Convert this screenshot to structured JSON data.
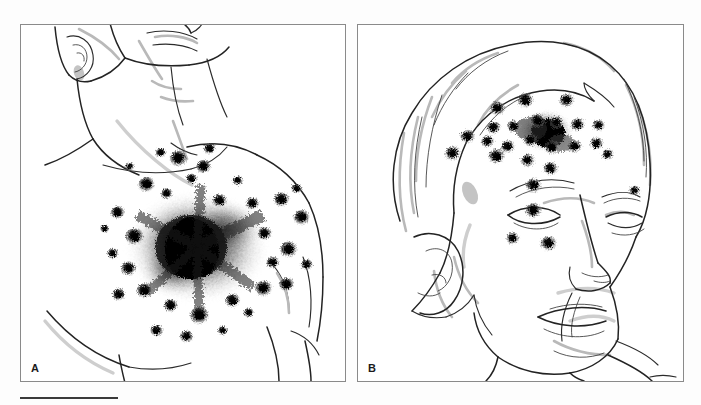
{
  "figure": {
    "background_color": "#fdfdfd",
    "ink_color": "#2b2b2b",
    "shade_color": "#c0c0c0",
    "soot_color": "#000000",
    "scale_bar": {
      "name": "scale-bar",
      "length_px": 98,
      "thickness_px": 2,
      "color": "#3a3a3a"
    }
  },
  "panels": [
    {
      "id": "A",
      "label": "A",
      "subject": "male-torso-chest",
      "view": "anterior chest and neck, head turned to subject's left",
      "wound": {
        "type": "contact-gunshot-entrance-wound",
        "location": "left anterior chest",
        "center_x": 192,
        "center_y": 245,
        "core_radius_px": 22,
        "soot_halo_radius_px": 78,
        "features": [
          "central perforation",
          "dense soot blackening",
          "surrounding powder tattooing",
          "satellite powder marks"
        ]
      },
      "stipple_count": 34
    },
    {
      "id": "B",
      "label": "B",
      "subject": "male-head-face",
      "view": "three-quarter left facial profile",
      "wound": {
        "type": "close-range-gunshot-entrance-wound",
        "location": "right forehead / supraorbital region",
        "center_x": 545,
        "center_y": 130,
        "core_radius_px": 12,
        "soot_halo_radius_px": 26,
        "features": [
          "entrance defect",
          "soot deposit",
          "dense powder tattooing over forehead and cheek"
        ]
      },
      "stipple_count": 26
    }
  ],
  "stipple_a": [
    {
      "x": 178,
      "y": 158,
      "r": 5.0
    },
    {
      "x": 203,
      "y": 166,
      "r": 4.2
    },
    {
      "x": 146,
      "y": 184,
      "r": 4.6
    },
    {
      "x": 117,
      "y": 212,
      "r": 4.0
    },
    {
      "x": 166,
      "y": 193,
      "r": 3.4
    },
    {
      "x": 219,
      "y": 200,
      "r": 4.0
    },
    {
      "x": 252,
      "y": 203,
      "r": 3.8
    },
    {
      "x": 281,
      "y": 199,
      "r": 4.4
    },
    {
      "x": 301,
      "y": 217,
      "r": 4.6
    },
    {
      "x": 264,
      "y": 233,
      "r": 4.0
    },
    {
      "x": 288,
      "y": 249,
      "r": 4.8
    },
    {
      "x": 134,
      "y": 236,
      "r": 5.2
    },
    {
      "x": 128,
      "y": 268,
      "r": 4.4
    },
    {
      "x": 144,
      "y": 290,
      "r": 4.6
    },
    {
      "x": 118,
      "y": 294,
      "r": 3.8
    },
    {
      "x": 170,
      "y": 305,
      "r": 4.0
    },
    {
      "x": 199,
      "y": 315,
      "r": 5.4
    },
    {
      "x": 232,
      "y": 300,
      "r": 4.2
    },
    {
      "x": 263,
      "y": 288,
      "r": 4.8
    },
    {
      "x": 286,
      "y": 284,
      "r": 4.2
    },
    {
      "x": 272,
      "y": 262,
      "r": 3.6
    },
    {
      "x": 156,
      "y": 330,
      "r": 3.6
    },
    {
      "x": 186,
      "y": 336,
      "r": 3.8
    },
    {
      "x": 112,
      "y": 253,
      "r": 3.2
    },
    {
      "x": 237,
      "y": 180,
      "r": 3.0
    },
    {
      "x": 191,
      "y": 178,
      "r": 3.2
    },
    {
      "x": 248,
      "y": 312,
      "r": 3.0
    },
    {
      "x": 306,
      "y": 264,
      "r": 3.4
    },
    {
      "x": 160,
      "y": 152,
      "r": 3.0
    },
    {
      "x": 209,
      "y": 148,
      "r": 3.4
    },
    {
      "x": 129,
      "y": 166,
      "r": 2.6
    },
    {
      "x": 296,
      "y": 188,
      "r": 3.0
    },
    {
      "x": 222,
      "y": 330,
      "r": 2.8
    },
    {
      "x": 104,
      "y": 228,
      "r": 2.6
    }
  ],
  "stipple_b": [
    {
      "x": 497,
      "y": 108,
      "r": 4.4
    },
    {
      "x": 525,
      "y": 100,
      "r": 4.6
    },
    {
      "x": 566,
      "y": 100,
      "r": 4.2
    },
    {
      "x": 493,
      "y": 127,
      "r": 4.0
    },
    {
      "x": 513,
      "y": 126,
      "r": 3.8
    },
    {
      "x": 537,
      "y": 120,
      "r": 4.2
    },
    {
      "x": 556,
      "y": 122,
      "r": 3.8
    },
    {
      "x": 577,
      "y": 124,
      "r": 4.0
    },
    {
      "x": 598,
      "y": 125,
      "r": 3.6
    },
    {
      "x": 467,
      "y": 136,
      "r": 4.2
    },
    {
      "x": 487,
      "y": 141,
      "r": 3.8
    },
    {
      "x": 507,
      "y": 146,
      "r": 4.0
    },
    {
      "x": 530,
      "y": 140,
      "r": 3.8
    },
    {
      "x": 551,
      "y": 147,
      "r": 4.2
    },
    {
      "x": 574,
      "y": 146,
      "r": 4.0
    },
    {
      "x": 596,
      "y": 143,
      "r": 3.8
    },
    {
      "x": 452,
      "y": 153,
      "r": 4.4
    },
    {
      "x": 496,
      "y": 156,
      "r": 4.6
    },
    {
      "x": 527,
      "y": 160,
      "r": 4.0
    },
    {
      "x": 550,
      "y": 168,
      "r": 4.2
    },
    {
      "x": 533,
      "y": 185,
      "r": 4.4
    },
    {
      "x": 533,
      "y": 210,
      "r": 4.6
    },
    {
      "x": 512,
      "y": 238,
      "r": 3.8
    },
    {
      "x": 548,
      "y": 243,
      "r": 4.6
    },
    {
      "x": 634,
      "y": 190,
      "r": 3.2
    },
    {
      "x": 607,
      "y": 154,
      "r": 3.4
    }
  ]
}
